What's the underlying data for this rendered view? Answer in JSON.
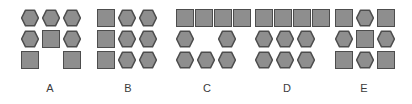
{
  "board": {
    "background_color": "#ffffff",
    "shape_fill_color": "#8e8e8e",
    "shape_stroke_color": "#4d4d4d",
    "label_color": "#3b3b3b"
  },
  "options": [
    {
      "label": "A",
      "left": 14,
      "width": 72,
      "grid_left": 6,
      "rows": [
        [
          "hex",
          "hex",
          "hex"
        ],
        [
          "hex",
          "square",
          "hex"
        ],
        [
          "square",
          "empty",
          "square"
        ]
      ]
    },
    {
      "label": "B",
      "left": 92,
      "width": 72,
      "grid_left": 4,
      "rows": [
        [
          "square",
          "hex",
          "hex"
        ],
        [
          "square",
          "hex",
          "hex"
        ],
        [
          "square",
          "hex",
          "hex"
        ]
      ]
    },
    {
      "label": "C",
      "left": 170,
      "width": 74,
      "grid_left": 5,
      "rows": [
        [
          "square",
          "square",
          "square",
          "square"
        ],
        [
          "hex",
          "empty",
          "hex"
        ],
        [
          "hex",
          "hex",
          "hex"
        ]
      ]
    },
    {
      "label": "D",
      "left": 248,
      "width": 78,
      "grid_left": 6,
      "rows": [
        [
          "square",
          "square",
          "square",
          "square"
        ],
        [
          "hex",
          "hex",
          "hex"
        ],
        [
          "hex",
          "hex",
          "hex"
        ]
      ]
    },
    {
      "label": "E",
      "left": 326,
      "width": 76,
      "grid_left": 8,
      "rows": [
        [
          "square",
          "hex",
          "square"
        ],
        [
          "hex",
          "square",
          "hex"
        ],
        [
          "square",
          "hex",
          "square"
        ]
      ]
    }
  ]
}
